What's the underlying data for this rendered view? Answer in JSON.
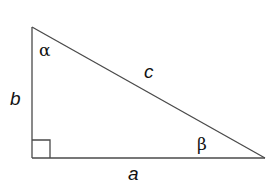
{
  "diagram": {
    "type": "right-triangle",
    "colors": {
      "stroke": "#4a4a4a",
      "text": "#111111",
      "background": "#ffffff"
    },
    "vertices": {
      "top": [
        32,
        27
      ],
      "right_angle": [
        32,
        158
      ],
      "right": [
        265,
        158
      ]
    },
    "sides": {
      "a": "a",
      "b": "b",
      "c": "c"
    },
    "angles": {
      "alpha": "α",
      "beta": "β"
    },
    "right_angle_marker_size": 18
  }
}
